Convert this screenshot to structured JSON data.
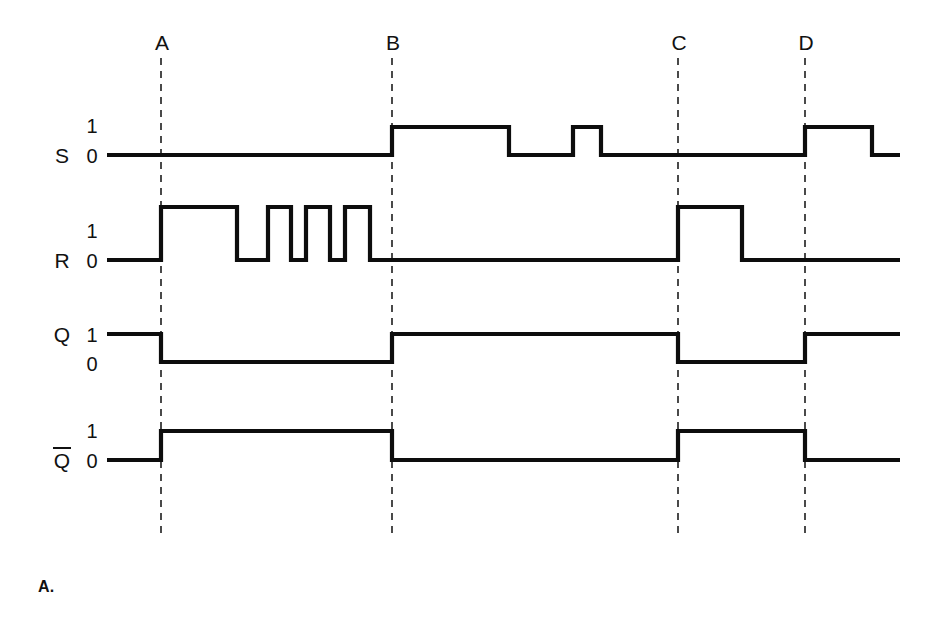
{
  "figure": {
    "caption": "A.",
    "background_color": "#ffffff",
    "trace_color": "#0d0d0d",
    "marker_color": "#2b2b2b"
  },
  "markers": [
    {
      "label": "A",
      "x": 161
    },
    {
      "label": "B",
      "x": 392
    },
    {
      "label": "C",
      "x": 678
    },
    {
      "label": "D",
      "x": 805
    }
  ],
  "marker_geometry": {
    "label_y": 50,
    "line_top": 58,
    "line_bottom": 536
  },
  "signals": [
    {
      "name": "S",
      "overbar": false,
      "name_x": 62,
      "name_y": 163,
      "level_high_label": "1",
      "level_low_label": "0",
      "level_high_x": 92,
      "level_high_y": 133,
      "level_low_x": 92,
      "level_low_y": 163,
      "y_high": 127,
      "y_low": 155,
      "x_start": 107,
      "x_end": 900,
      "transitions": [
        {
          "x": 392,
          "level": 1
        },
        {
          "x": 509,
          "level": 0
        },
        {
          "x": 573,
          "level": 1
        },
        {
          "x": 601,
          "level": 0
        },
        {
          "x": 805,
          "level": 1
        },
        {
          "x": 872,
          "level": 0
        }
      ],
      "initial_level": 0
    },
    {
      "name": "R",
      "overbar": false,
      "name_x": 62,
      "name_y": 268,
      "level_high_label": "1",
      "level_low_label": "0",
      "level_high_x": 92,
      "level_high_y": 238,
      "level_low_x": 92,
      "level_low_y": 268,
      "y_high": 207,
      "y_low": 260,
      "x_start": 107,
      "x_end": 900,
      "transitions": [
        {
          "x": 161,
          "level": 1
        },
        {
          "x": 237,
          "level": 0
        },
        {
          "x": 268,
          "level": 1
        },
        {
          "x": 291,
          "level": 0
        },
        {
          "x": 306,
          "level": 1
        },
        {
          "x": 330,
          "level": 0
        },
        {
          "x": 345,
          "level": 1
        },
        {
          "x": 370,
          "level": 0
        },
        {
          "x": 678,
          "level": 1
        },
        {
          "x": 742,
          "level": 0
        }
      ],
      "initial_level": 0
    },
    {
      "name": "Q",
      "overbar": false,
      "name_x": 62,
      "name_y": 342,
      "level_high_label": "1",
      "level_low_label": "0",
      "level_high_x": 92,
      "level_high_y": 342,
      "level_low_x": 92,
      "level_low_y": 371,
      "y_high": 334,
      "y_low": 362,
      "x_start": 107,
      "x_end": 900,
      "transitions": [
        {
          "x": 161,
          "level": 0
        },
        {
          "x": 392,
          "level": 1
        },
        {
          "x": 678,
          "level": 0
        },
        {
          "x": 805,
          "level": 1
        }
      ],
      "initial_level": 1
    },
    {
      "name": "Q",
      "overbar": true,
      "name_x": 62,
      "name_y": 468,
      "level_high_label": "1",
      "level_low_label": "0",
      "level_high_x": 92,
      "level_high_y": 438,
      "level_low_x": 92,
      "level_low_y": 468,
      "y_high": 431,
      "y_low": 460,
      "x_start": 107,
      "x_end": 900,
      "transitions": [
        {
          "x": 161,
          "level": 1
        },
        {
          "x": 392,
          "level": 0
        },
        {
          "x": 678,
          "level": 1
        },
        {
          "x": 805,
          "level": 0
        }
      ],
      "initial_level": 0
    }
  ],
  "chart_data": {
    "type": "line",
    "title": "",
    "subtitle": "",
    "xlabel": "",
    "ylabel": "",
    "grid": false,
    "legend_position": "none",
    "xlim": [
      107,
      900
    ],
    "ylim": [
      0,
      1
    ],
    "x_annotations": [
      {
        "label": "A",
        "x": 161
      },
      {
        "label": "B",
        "x": 392
      },
      {
        "label": "C",
        "x": 678
      },
      {
        "label": "D",
        "x": 805
      }
    ],
    "y_tick_labels": [
      "0",
      "1"
    ],
    "series": [
      {
        "name": "S",
        "type": "digital",
        "initial_value": 0,
        "x": [
          107,
          392,
          509,
          573,
          601,
          805,
          872,
          900
        ],
        "values": [
          0,
          1,
          0,
          1,
          0,
          1,
          0,
          0
        ]
      },
      {
        "name": "R",
        "type": "digital",
        "initial_value": 0,
        "x": [
          107,
          161,
          237,
          268,
          291,
          306,
          330,
          345,
          370,
          678,
          742,
          900
        ],
        "values": [
          0,
          1,
          0,
          1,
          0,
          1,
          0,
          1,
          0,
          1,
          0,
          0
        ]
      },
      {
        "name": "Q",
        "type": "digital",
        "initial_value": 1,
        "x": [
          107,
          161,
          392,
          678,
          805,
          900
        ],
        "values": [
          1,
          0,
          1,
          0,
          1,
          1
        ]
      },
      {
        "name": "Q̅",
        "type": "digital",
        "initial_value": 0,
        "x": [
          107,
          161,
          392,
          678,
          805,
          900
        ],
        "values": [
          0,
          1,
          0,
          1,
          0,
          0
        ]
      }
    ]
  }
}
